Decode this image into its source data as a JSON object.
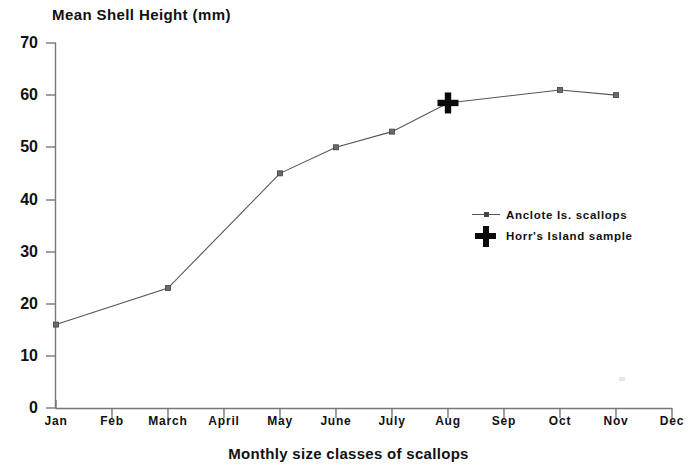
{
  "chart_data": {
    "type": "line",
    "title": "Mean Shell Height (mm)",
    "xlabel": "Monthly size classes of scallops",
    "ylabel": "Mean Shell Height (mm)",
    "ylim": [
      0,
      70
    ],
    "yticks": [
      0,
      10,
      20,
      30,
      40,
      50,
      60,
      70
    ],
    "categories": [
      "Jan",
      "Feb",
      "March",
      "April",
      "May",
      "June",
      "July",
      "Aug",
      "Sep",
      "Oct",
      "Nov",
      "Dec"
    ],
    "grid": false,
    "legend_position": "center-right",
    "series": [
      {
        "name": "Anclote Is. scallops",
        "marker": "square",
        "color": "#555555",
        "points": [
          {
            "x": "Jan",
            "y": 16
          },
          {
            "x": "March",
            "y": 23
          },
          {
            "x": "May",
            "y": 45
          },
          {
            "x": "June",
            "y": 50
          },
          {
            "x": "July",
            "y": 53
          },
          {
            "x": "Aug",
            "y": 58.5
          },
          {
            "x": "Oct",
            "y": 61
          },
          {
            "x": "Nov",
            "y": 60
          }
        ]
      },
      {
        "name": "Horr's Island sample",
        "marker": "cross",
        "color": "#0a0a0a",
        "points": [
          {
            "x": "Aug",
            "y": 58.5
          }
        ]
      }
    ]
  },
  "legend": {
    "items": [
      {
        "label": "Anclote Is. scallops",
        "marker": "line-square"
      },
      {
        "label": "Horr's Island sample",
        "marker": "cross"
      }
    ]
  },
  "axes": {
    "y_tick_labels": [
      "70",
      "60",
      "50",
      "40",
      "30",
      "20",
      "10",
      "0"
    ],
    "x_tick_labels": [
      "Jan",
      "Feb",
      "March",
      "April",
      "May",
      "June",
      "July",
      "Aug",
      "Sep",
      "Oct",
      "Nov",
      "Dec"
    ]
  }
}
